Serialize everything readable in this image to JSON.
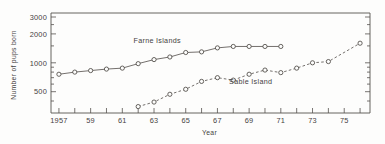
{
  "figure": {
    "background": "#fdfdfc",
    "ink_color": "#45423f",
    "kind": "scanned-line-chart"
  },
  "chart_data": {
    "type": "line",
    "title": "",
    "subtitle": "",
    "xlabel": "Year",
    "ylabel": "Number of pups born",
    "yscale": "log",
    "ylim": [
      300,
      3000
    ],
    "xlim": [
      1956.5,
      1976.5
    ],
    "grid": false,
    "legend_position": "inline-annotations",
    "ytick_values": [
      500,
      1000,
      2000,
      3000
    ],
    "ytick_labels": [
      "500",
      "1000",
      "2000",
      "3000"
    ],
    "yminor_ticks": [
      400,
      600,
      700,
      800,
      900,
      1500,
      2500
    ],
    "xtick_values": [
      1957,
      1958,
      1959,
      1960,
      1961,
      1962,
      1963,
      1964,
      1965,
      1966,
      1967,
      1968,
      1969,
      1970,
      1971,
      1972,
      1973,
      1974,
      1975,
      1976
    ],
    "xtick_labels": [
      "1957",
      "",
      "59",
      "",
      "61",
      "",
      "63",
      "",
      "65",
      "",
      "67",
      "",
      "69",
      "",
      "71",
      "",
      "73",
      "",
      "75",
      ""
    ],
    "series": [
      {
        "name": "Farne Islands",
        "marker": "open-circle",
        "linestyle": "solid",
        "label_x": 1963.2,
        "label_y": 1620,
        "x": [
          1957,
          1958,
          1959,
          1960,
          1961,
          1962,
          1963,
          1964,
          1965,
          1966,
          1967,
          1968,
          1969,
          1970,
          1971
        ],
        "y": [
          760,
          800,
          830,
          860,
          880,
          980,
          1080,
          1150,
          1280,
          1300,
          1430,
          1480,
          1480,
          1480,
          1480
        ]
      },
      {
        "name": "Sable Island",
        "marker": "open-circle",
        "linestyle": "dashed",
        "label_x": 1969.1,
        "label_y": 600,
        "x": [
          1962,
          1963,
          1964,
          1965,
          1966,
          1967,
          1968,
          1969,
          1970,
          1971,
          1972,
          1973,
          1974,
          1976
        ],
        "y": [
          350,
          390,
          470,
          530,
          640,
          700,
          660,
          760,
          840,
          790,
          880,
          1000,
          1030,
          1600
        ]
      }
    ]
  }
}
